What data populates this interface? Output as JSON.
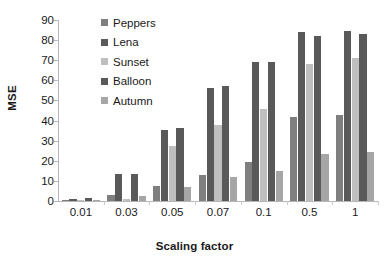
{
  "chart_data": {
    "type": "bar",
    "title": "",
    "xlabel": "Scaling factor",
    "ylabel": "MSE",
    "categories": [
      "0.01",
      "0.03",
      "0.05",
      "0.07",
      "0.1",
      "0.5",
      "1"
    ],
    "ylim": [
      0,
      90
    ],
    "yticks": [
      0,
      10,
      20,
      30,
      40,
      50,
      60,
      70,
      80,
      90
    ],
    "ytick_labels": [
      "0",
      "10",
      "20",
      "30",
      "40",
      "50",
      "60",
      "70",
      "80",
      "90"
    ],
    "grid": false,
    "legend_position": "top-left-inside",
    "series": [
      {
        "name": "Peppers",
        "color": "#7f7f7f",
        "values": [
          0.3,
          3.0,
          7.5,
          13.0,
          19.5,
          42.0,
          43.0
        ]
      },
      {
        "name": "Lena",
        "color": "#595959",
        "values": [
          1.2,
          13.2,
          35.5,
          56.0,
          69.0,
          84.0,
          84.5
        ]
      },
      {
        "name": "Sunset",
        "color": "#bfbfbf",
        "values": [
          0.3,
          1.0,
          27.5,
          38.0,
          46.0,
          68.0,
          71.0
        ]
      },
      {
        "name": "Balloon",
        "color": "#595959",
        "values": [
          1.3,
          13.2,
          36.5,
          57.0,
          69.0,
          82.0,
          83.0
        ]
      },
      {
        "name": "Autumn",
        "color": "#a6a6a6",
        "values": [
          0.3,
          2.5,
          7.0,
          12.0,
          15.0,
          23.5,
          24.5
        ]
      }
    ]
  },
  "axis": {
    "ylabel": "MSE",
    "xlabel": "Scaling factor"
  }
}
